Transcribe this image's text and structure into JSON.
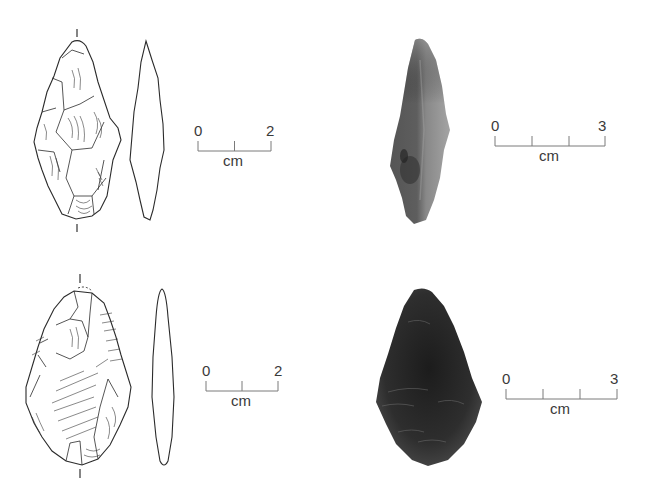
{
  "figure": {
    "artifacts": [
      {
        "id": "a1",
        "kind": "drawing",
        "views": [
          "dorsal-face",
          "lateral-profile"
        ],
        "scale": {
          "start_label": "0",
          "end_label": "2",
          "unit_label": "cm",
          "divisions": 2
        }
      },
      {
        "id": "a1-photo",
        "kind": "photograph",
        "tone": "grey",
        "scale": {
          "start_label": "0",
          "end_label": "3",
          "unit_label": "cm",
          "divisions": 3
        }
      },
      {
        "id": "a2",
        "kind": "drawing",
        "views": [
          "dorsal-face",
          "lateral-profile"
        ],
        "scale": {
          "start_label": "0",
          "end_label": "2",
          "unit_label": "cm",
          "divisions": 2
        }
      },
      {
        "id": "a2-photo",
        "kind": "photograph",
        "tone": "dark",
        "scale": {
          "start_label": "0",
          "end_label": "3",
          "unit_label": "cm",
          "divisions": 3
        }
      }
    ],
    "colors": {
      "ink": "#2b2b2b",
      "scale_line": "#7a7a7a",
      "photo_grey": "#6e6e6e",
      "photo_dark": "#2a2a2a"
    }
  }
}
